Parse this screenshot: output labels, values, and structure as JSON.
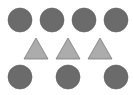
{
  "figure": {
    "width": 134,
    "height": 95,
    "background": "#ffffff",
    "colors": {
      "circle_fill": "#6b6b6b",
      "circle_stroke": "#5e5e5e",
      "triangle_fill": "#acacac",
      "triangle_stroke": "#7a7a7a"
    },
    "rows": [
      {
        "name": "top-row",
        "shape": "circle",
        "count": 4,
        "items": [
          {
            "cx": 20,
            "cy": 20,
            "r": 12
          },
          {
            "cx": 52,
            "cy": 20,
            "r": 12
          },
          {
            "cx": 84,
            "cy": 20,
            "r": 12
          },
          {
            "cx": 116,
            "cy": 20,
            "r": 12
          }
        ]
      },
      {
        "name": "middle-row",
        "shape": "triangle",
        "count": 3,
        "items": [
          {
            "cx": 36,
            "top": 38,
            "base": 59,
            "half_width": 12
          },
          {
            "cx": 68,
            "top": 38,
            "base": 59,
            "half_width": 12
          },
          {
            "cx": 100,
            "top": 38,
            "base": 59,
            "half_width": 12
          }
        ]
      },
      {
        "name": "bottom-row",
        "shape": "circle",
        "count": 3,
        "items": [
          {
            "cx": 20,
            "cy": 77,
            "r": 12
          },
          {
            "cx": 68,
            "cy": 77,
            "r": 12
          },
          {
            "cx": 116,
            "cy": 77,
            "r": 12
          }
        ]
      }
    ]
  }
}
